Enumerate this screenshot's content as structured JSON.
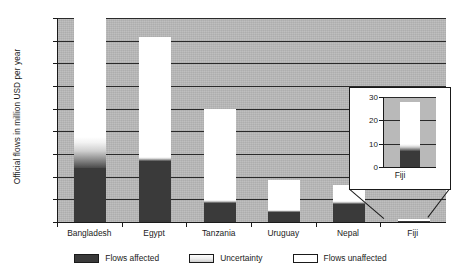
{
  "chart_data": {
    "type": "bar",
    "title": "",
    "subtitle": "",
    "xlabel": "",
    "ylabel": "Official flows in million USD per year",
    "ylim": [
      0,
      1800
    ],
    "ytick_labels": [
      "0",
      "200",
      "400",
      "600",
      "800",
      "1,000",
      "1,200",
      "1,400",
      "1,600",
      "1,800"
    ],
    "ytick_values": [
      0,
      200,
      400,
      600,
      800,
      1000,
      1200,
      1400,
      1600,
      1800
    ],
    "grid": true,
    "legend_position": "bottom",
    "categories": [
      "Bangladesh",
      "Egypt",
      "Tanzania",
      "Uruguay",
      "Nepal",
      "Fiji"
    ],
    "series": [
      {
        "name": "Flows affected",
        "color": "#3a3a3a",
        "values": [
          480,
          540,
          165,
          85,
          160,
          7
        ]
      },
      {
        "name": "Uncertainty",
        "color": "#cfcfcf",
        "values": [
          270,
          30,
          30,
          25,
          25,
          3
        ]
      },
      {
        "name": "Flows unaffected",
        "color": "#ffffff",
        "values": [
          1050,
          1060,
          805,
          260,
          145,
          18
        ]
      }
    ],
    "totals": [
      1800,
      1630,
      1000,
      370,
      330,
      28
    ],
    "inset": {
      "category": "Fiji",
      "ylim": [
        0,
        30
      ],
      "ytick_labels": [
        "0",
        "10",
        "20",
        "30"
      ],
      "ytick_values": [
        0,
        10,
        20,
        30
      ],
      "affected": 7,
      "uncertainty": 3,
      "unaffected": 18,
      "total": 28
    }
  },
  "axis": {
    "y_title": "Official flows in million USD per year"
  },
  "legend": {
    "items": [
      {
        "label": "Flows affected",
        "key": "affected"
      },
      {
        "label": "Uncertainty",
        "key": "uncertainty"
      },
      {
        "label": "Flows unaffected",
        "key": "unaffected"
      }
    ]
  },
  "inset_label": "Fiji"
}
